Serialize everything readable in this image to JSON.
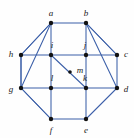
{
  "figure": {
    "width": 134,
    "height": 138,
    "background_color": "#fefefe",
    "edge_color": "#3b5fa8",
    "vertex_color": "#121212",
    "label_color": "#1a1a1a"
  },
  "graph_data": {
    "type": "diagram",
    "layout": "octagon-with-inner-square",
    "vertices": [
      {
        "id": "a",
        "label": "a",
        "x": 51,
        "y": 23,
        "label_x": 51,
        "label_y": 13,
        "radius": 2.2
      },
      {
        "id": "b",
        "label": "b",
        "x": 86,
        "y": 23,
        "label_x": 86,
        "label_y": 13,
        "radius": 2.2
      },
      {
        "id": "c",
        "label": "c",
        "x": 117,
        "y": 55,
        "label_x": 126,
        "label_y": 54,
        "radius": 2.2
      },
      {
        "id": "d",
        "label": "d",
        "x": 117,
        "y": 88,
        "label_x": 126,
        "label_y": 89,
        "radius": 2.2
      },
      {
        "id": "e",
        "label": "e",
        "x": 86,
        "y": 119,
        "label_x": 86,
        "label_y": 130,
        "radius": 2.2
      },
      {
        "id": "f",
        "label": "f",
        "x": 51,
        "y": 119,
        "label_x": 51,
        "label_y": 130,
        "radius": 2.2
      },
      {
        "id": "g",
        "label": "g",
        "x": 21,
        "y": 88,
        "label_x": 11,
        "label_y": 89,
        "radius": 2.2
      },
      {
        "id": "h",
        "label": "h",
        "x": 21,
        "y": 55,
        "label_x": 11,
        "label_y": 54,
        "radius": 2.2
      },
      {
        "id": "i",
        "label": "i",
        "x": 51,
        "y": 55,
        "label_x": 52,
        "label_y": 45,
        "radius": 2.2
      },
      {
        "id": "j",
        "label": "j",
        "x": 86,
        "y": 55,
        "label_x": 85,
        "label_y": 45,
        "radius": 2.2
      },
      {
        "id": "k",
        "label": "k",
        "x": 86,
        "y": 88,
        "label_x": 85,
        "label_y": 78,
        "radius": 2.2
      },
      {
        "id": "l",
        "label": "l",
        "x": 51,
        "y": 88,
        "label_x": 52,
        "label_y": 78,
        "radius": 2.2
      },
      {
        "id": "m",
        "label": "m",
        "x": 70,
        "y": 72,
        "label_x": 80,
        "label_y": 70,
        "radius": 1.8
      }
    ],
    "edges": [
      {
        "from": "a",
        "to": "b",
        "group": "outer-ring"
      },
      {
        "from": "b",
        "to": "c",
        "group": "outer-ring"
      },
      {
        "from": "c",
        "to": "d",
        "group": "outer-ring"
      },
      {
        "from": "d",
        "to": "e",
        "group": "outer-ring"
      },
      {
        "from": "e",
        "to": "f",
        "group": "outer-ring"
      },
      {
        "from": "f",
        "to": "g",
        "group": "outer-ring"
      },
      {
        "from": "g",
        "to": "h",
        "group": "outer-ring"
      },
      {
        "from": "h",
        "to": "a",
        "group": "outer-ring"
      },
      {
        "from": "i",
        "to": "j",
        "group": "inner-square"
      },
      {
        "from": "j",
        "to": "k",
        "group": "inner-square"
      },
      {
        "from": "k",
        "to": "l",
        "group": "inner-square"
      },
      {
        "from": "l",
        "to": "i",
        "group": "inner-square"
      },
      {
        "from": "a",
        "to": "i",
        "group": "spoke"
      },
      {
        "from": "b",
        "to": "j",
        "group": "spoke"
      },
      {
        "from": "c",
        "to": "j",
        "group": "spoke"
      },
      {
        "from": "d",
        "to": "k",
        "group": "spoke"
      },
      {
        "from": "e",
        "to": "k",
        "group": "spoke"
      },
      {
        "from": "f",
        "to": "l",
        "group": "spoke"
      },
      {
        "from": "g",
        "to": "l",
        "group": "spoke"
      },
      {
        "from": "h",
        "to": "i",
        "group": "spoke"
      },
      {
        "from": "a",
        "to": "h",
        "group": "diagonal"
      },
      {
        "from": "a",
        "to": "g",
        "group": "diagonal"
      },
      {
        "from": "b",
        "to": "c",
        "group": "diagonal"
      },
      {
        "from": "b",
        "to": "d",
        "group": "diagonal"
      },
      {
        "from": "g",
        "to": "f",
        "group": "diagonal"
      },
      {
        "from": "d",
        "to": "e",
        "group": "diagonal"
      },
      {
        "from": "h",
        "to": "g",
        "group": "diagonal"
      },
      {
        "from": "i",
        "to": "k",
        "group": "center-diagonal"
      }
    ]
  }
}
